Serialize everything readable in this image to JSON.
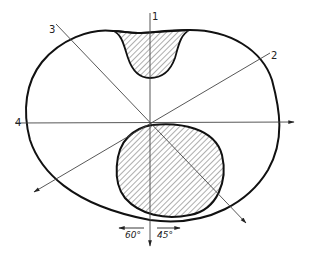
{
  "diagram": {
    "type": "cross-section technical drawing",
    "axes": [
      {
        "id": "axis-1",
        "label": "1",
        "direction": "vertical"
      },
      {
        "id": "axis-2",
        "label": "2",
        "direction": "oblique-up-right"
      },
      {
        "id": "axis-3",
        "label": "3",
        "direction": "oblique-up-left"
      },
      {
        "id": "axis-4",
        "label": "4",
        "direction": "horizontal"
      }
    ],
    "angles": {
      "left": "60°",
      "right": "45°"
    },
    "regions": [
      {
        "id": "upper-hatched-region",
        "fill": "hatched"
      },
      {
        "id": "lower-hatched-region",
        "fill": "hatched"
      }
    ],
    "colors": {
      "stroke": "#111111",
      "thin_line": "#444444",
      "background": "#ffffff"
    }
  }
}
